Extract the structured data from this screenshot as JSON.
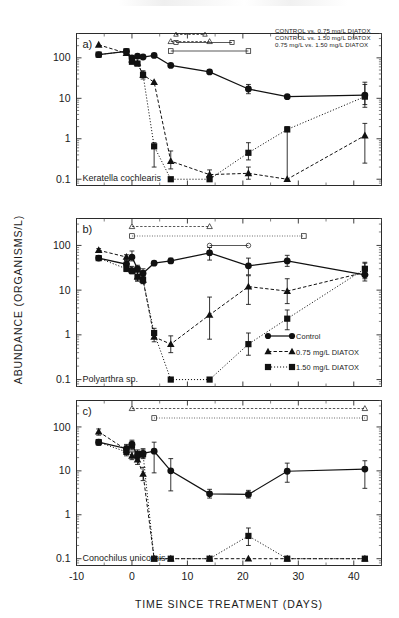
{
  "figure": {
    "axis_y_title": "ABUNDANCE (ORGANISMS/L)",
    "axis_x_title": "TIME SINCE TREATMENT (DAYS)",
    "y_ticks": [
      "0.1",
      "1",
      "10",
      "100"
    ],
    "x_ticks": [
      "-10",
      "0",
      "10",
      "20",
      "30",
      "40"
    ]
  },
  "panels": [
    {
      "label": "a)",
      "species": "Keratella cochlearis"
    },
    {
      "label": "b)",
      "species": "Polyarthra sp."
    },
    {
      "label": "c)",
      "species": "Conochilus unicornis"
    }
  ],
  "series_legend": {
    "title": "",
    "items": [
      {
        "name": "control",
        "label": "Control",
        "marker": "circle",
        "line": "solid"
      },
      {
        "name": "dose-low",
        "label": "0.75 mg/L DIATOX",
        "marker": "triangle",
        "line": "dashed"
      },
      {
        "name": "dose-high",
        "label": "1.50 mg/L DIATOX",
        "marker": "square",
        "line": "dotted"
      }
    ]
  },
  "significance_legend": {
    "lines": [
      "CONTROL vs. 0.75 mg/L DIATOX",
      "CONTROL vs. 1.50 mg/L DIATOX",
      "0.75 mg/L vs. 1.50 mg/L DIATOX"
    ]
  },
  "chart_data": {
    "type": "line",
    "title": "",
    "xlabel": "TIME SINCE TREATMENT (DAYS)",
    "ylabel": "ABUNDANCE (ORGANISMS/L)",
    "yscale": "log",
    "ylim": [
      0.07,
      400
    ],
    "xlim": [
      -10,
      45
    ],
    "ytick_values": [
      0.1,
      1,
      10,
      100
    ],
    "xtick_values": [
      -10,
      0,
      10,
      20,
      30,
      40
    ],
    "grid": false,
    "legend_position": "panel-b-lower-right",
    "panels": [
      {
        "label": "a)",
        "species": "Keratella cochlearis",
        "series": [
          {
            "name": "Control",
            "marker": "circle",
            "x": [
              -6,
              -1,
              0,
              1,
              2,
              4,
              7,
              14,
              21,
              28,
              42
            ],
            "y": [
              120,
              145,
              100,
              110,
              105,
              115,
              65,
              45,
              17,
              11,
              12
            ],
            "ylo": [
              120,
              130,
              90,
              100,
              95,
              115,
              65,
              45,
              13,
              11,
              6
            ],
            "yhi": [
              120,
              160,
              110,
              120,
              115,
              115,
              65,
              45,
              22,
              11,
              25
            ]
          },
          {
            "name": "0.75 mg/L DIATOX",
            "marker": "triangle",
            "x": [
              -6,
              -1,
              0,
              1,
              2,
              4,
              7,
              14,
              21,
              28,
              42
            ],
            "y": [
              210,
              130,
              90,
              75,
              38,
              25,
              0.28,
              0.13,
              0.14,
              0.1,
              1.2
            ],
            "ylo": [
              210,
              130,
              80,
              70,
              30,
              25,
              0.18,
              0.1,
              0.1,
              0.1,
              0.25
            ],
            "yhi": [
              210,
              130,
              100,
              82,
              48,
              25,
              0.5,
              0.17,
              0.2,
              0.1,
              2.4
            ]
          },
          {
            "name": "1.50 mg/L DIATOX",
            "marker": "square",
            "x": [
              -6,
              -1,
              0,
              1,
              2,
              4,
              7,
              14,
              21,
              28,
              42
            ],
            "y": [
              120,
              145,
              80,
              72,
              38,
              0.65,
              0.1,
              0.1,
              0.45,
              1.7,
              11
            ],
            "ylo": [
              120,
              145,
              75,
              66,
              33,
              0.2,
              0.1,
              0.1,
              0.3,
              0.1,
              7
            ],
            "yhi": [
              120,
              145,
              88,
              80,
              45,
              0.8,
              0.1,
              0.1,
              0.8,
              2.0,
              22
            ]
          }
        ],
        "significance_bars": [
          {
            "pair": "CONTROL vs. 0.75 mg/L DIATOX",
            "marker": "triangle",
            "style": "dashed",
            "x_start": 7,
            "x_end": 14
          },
          {
            "pair": "CONTROL vs. 1.50 mg/L DIATOX",
            "marker": "square",
            "style": "solid",
            "x_start": 7,
            "x_end": 21
          }
        ]
      },
      {
        "label": "b)",
        "species": "Polyarthra sp.",
        "series": [
          {
            "name": "Control",
            "marker": "circle",
            "x": [
              -6,
              -1,
              0,
              1,
              2,
              4,
              7,
              14,
              21,
              28,
              42
            ],
            "y": [
              52,
              38,
              55,
              30,
              24,
              40,
              45,
              68,
              35,
              45,
              22
            ],
            "ylo": [
              46,
              33,
              45,
              26,
              20,
              40,
              40,
              47,
              22,
              34,
              18
            ],
            "yhi": [
              58,
              46,
              75,
              36,
              30,
              40,
              52,
              90,
              52,
              60,
              28
            ]
          },
          {
            "name": "0.75 mg/L DIATOX",
            "marker": "triangle",
            "x": [
              -6,
              -1,
              0,
              1,
              2,
              4,
              7,
              14,
              21,
              28,
              42
            ],
            "y": [
              78,
              55,
              28,
              20,
              17,
              0.9,
              0.62,
              2.8,
              12,
              9.5,
              25
            ],
            "ylo": [
              70,
              48,
              24,
              16,
              14,
              0.7,
              0.4,
              0.8,
              4.8,
              5.0,
              16
            ],
            "yhi": [
              85,
              62,
              34,
              26,
              21,
              1.2,
              0.95,
              7.0,
              21,
              18,
              40
            ]
          },
          {
            "name": "1.50 mg/L DIATOX",
            "marker": "square",
            "x": [
              -6,
              -1,
              0,
              1,
              2,
              4,
              7,
              14,
              21,
              28,
              42
            ],
            "y": [
              52,
              30,
              27,
              20,
              17,
              1.1,
              0.1,
              0.1,
              0.62,
              2.3,
              30
            ],
            "ylo": [
              52,
              26,
              23,
              16,
              14,
              0.85,
              0.1,
              0.1,
              0.35,
              1.3,
              20
            ],
            "yhi": [
              52,
              35,
              31,
              25,
              21,
              1.4,
              0.1,
              0.1,
              1.1,
              3.6,
              42
            ]
          }
        ],
        "significance_bars": [
          {
            "pair": "CONTROL vs. 0.75 mg/L DIATOX",
            "marker": "triangle",
            "style": "dashed",
            "x_start": 0,
            "x_end": 14
          },
          {
            "pair": "CONTROL vs. 1.50 mg/L DIATOX",
            "marker": "square",
            "style": "dotted",
            "x_start": 0,
            "x_end": 31
          },
          {
            "pair": "0.75 mg/L vs. 1.50 mg/L DIATOX",
            "marker": "circle",
            "style": "solid",
            "x_start": 14,
            "x_end": 21
          }
        ]
      },
      {
        "label": "c)",
        "species": "Conochilus unicornis",
        "series": [
          {
            "name": "Control",
            "marker": "circle",
            "x": [
              -6,
              -1,
              0,
              1,
              2,
              4,
              7,
              14,
              21,
              28,
              42
            ],
            "y": [
              45,
              32,
              40,
              22,
              25,
              28,
              10,
              3.0,
              2.9,
              9.8,
              11
            ],
            "ylo": [
              38,
              26,
              32,
              18,
              20,
              9.0,
              3.5,
              2.4,
              2.4,
              5.5,
              4.0
            ],
            "yhi": [
              52,
              40,
              50,
              28,
              32,
              45,
              19,
              3.8,
              3.6,
              15,
              17
            ]
          },
          {
            "name": "0.75 mg/L DIATOX",
            "marker": "triangle",
            "x": [
              -6,
              -1,
              0,
              1,
              2,
              4,
              7,
              14,
              21,
              28,
              42
            ],
            "y": [
              78,
              30,
              22,
              18,
              8.5,
              0.1,
              0.1,
              0.1,
              0.1,
              0.1,
              0.1
            ],
            "ylo": [
              65,
              24,
              18,
              14,
              6.0,
              0.1,
              0.1,
              0.1,
              0.1,
              0.1,
              0.1
            ],
            "yhi": [
              90,
              37,
              27,
              23,
              12,
              0.1,
              0.1,
              0.1,
              0.1,
              0.1,
              0.1
            ]
          },
          {
            "name": "1.50 mg/L DIATOX",
            "marker": "square",
            "x": [
              -6,
              -1,
              0,
              1,
              2,
              4,
              7,
              14,
              21,
              28,
              42
            ],
            "y": [
              45,
              27,
              38,
              24,
              24,
              0.1,
              0.1,
              0.1,
              0.33,
              0.1,
              0.1
            ],
            "ylo": [
              45,
              22,
              30,
              19,
              19,
              0.1,
              0.1,
              0.1,
              0.2,
              0.1,
              0.1
            ],
            "yhi": [
              45,
              33,
              47,
              30,
              30,
              0.1,
              0.1,
              0.1,
              0.5,
              0.1,
              0.1
            ]
          }
        ],
        "significance_bars": [
          {
            "pair": "CONTROL vs. 0.75 mg/L DIATOX",
            "marker": "triangle",
            "style": "dashed",
            "x_start": 0,
            "x_end": 42
          },
          {
            "pair": "CONTROL vs. 1.50 mg/L DIATOX",
            "marker": "square",
            "style": "dotted",
            "x_start": 4,
            "x_end": 42
          }
        ]
      }
    ]
  }
}
